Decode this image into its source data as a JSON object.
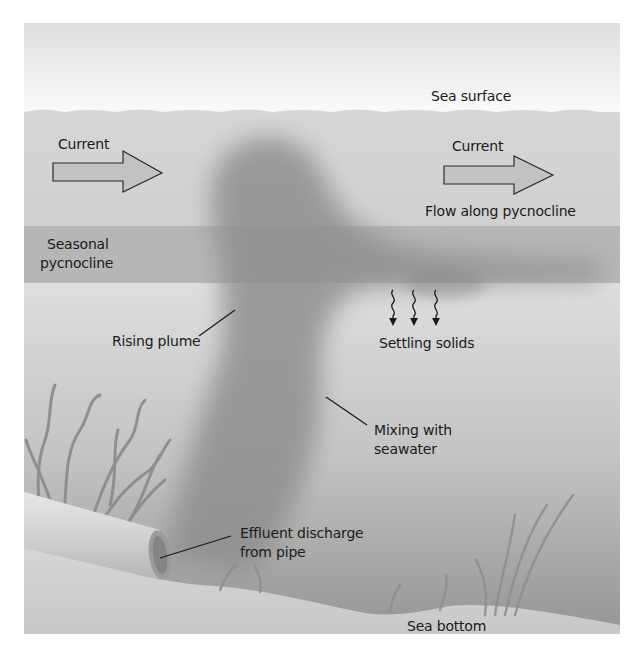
{
  "figure": {
    "type": "cross-section diagram",
    "colors": {
      "air": "#f4f4f4",
      "surface_water": "#dcdcdc",
      "pycnocline_band": "#b5b5b5",
      "deep_water_top": "#d9d9d9",
      "deep_water_bottom": "#9a9a9a",
      "sea_bottom": "#cfcfcf",
      "plume": "#8c8c8c",
      "arrow_fill": "#c2c2c2",
      "text": "#1a1a1a"
    }
  },
  "labels": {
    "sea_surface": "Sea surface",
    "current_left": "Current",
    "current_right": "Current",
    "flow_along_pycnocline": "Flow along pycnocline",
    "seasonal_pycnocline_line1": "Seasonal",
    "seasonal_pycnocline_line2": "pycnocline",
    "rising_plume": "Rising plume",
    "settling_solids": "Settling solids",
    "mixing_line1": "Mixing with",
    "mixing_line2": "seawater",
    "effluent_line1": "Effluent discharge",
    "effluent_line2": "from pipe",
    "sea_bottom": "Sea bottom"
  }
}
